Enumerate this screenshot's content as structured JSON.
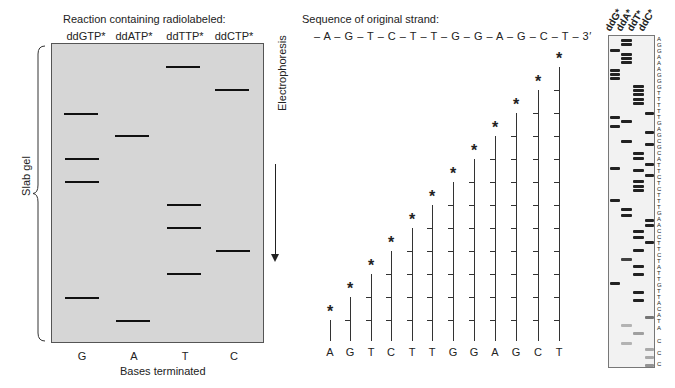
{
  "left_panel": {
    "title": "Reaction containing radiolabeled:",
    "lane_headers": [
      "ddGTP*",
      "ddATP*",
      "ddTTP*",
      "ddCTP*"
    ],
    "base_labels": [
      "G",
      "A",
      "T",
      "C"
    ],
    "x_axis_label": "Bases terminated",
    "side_label": "Slab gel",
    "arrow_label": "Electrophoresis",
    "bands": {
      "G": [
        113,
        158,
        181,
        297
      ],
      "A": [
        135,
        320
      ],
      "T": [
        66,
        204,
        227,
        273
      ],
      "C": [
        89,
        250
      ]
    }
  },
  "middle_panel": {
    "title": "Sequence of original strand:",
    "sequence_text": "– A – G – T – C – T – T – G – G – A – G – C – T – 3′",
    "fragments": [
      "A",
      "G",
      "T",
      "C",
      "T",
      "T",
      "G",
      "G",
      "A",
      "G",
      "C",
      "T"
    ],
    "star_symbol": "*"
  },
  "right_panel": {
    "lane_headers": [
      "ddG*",
      "ddA*",
      "ddT*",
      "ddC*"
    ],
    "read_sequence": [
      "A",
      "G",
      "G",
      "A",
      "A",
      "A",
      "G",
      "G",
      "G",
      "T",
      "T",
      "T",
      "T",
      "T",
      "G",
      "A",
      "G",
      "C",
      "G",
      "C",
      "A",
      "T",
      "T",
      "C",
      "T",
      "C",
      "T",
      "T",
      "T",
      "G",
      "A",
      "A",
      "C",
      "C",
      "T",
      "T",
      "C",
      "T",
      "A",
      "T",
      "T",
      "G",
      "T",
      "T",
      "A",
      "C",
      "A",
      "T",
      "A",
      "C",
      "C",
      "C"
    ]
  }
}
